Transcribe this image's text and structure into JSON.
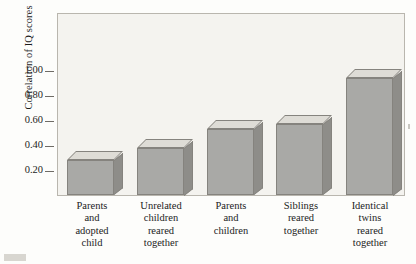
{
  "chart_data": {
    "type": "bar",
    "title": "",
    "xlabel": "",
    "ylabel": "Correlation of IQ scores",
    "categories": [
      "Parents and adopted child",
      "Unrelated children reared together",
      "Parents and children",
      "Siblings reared together",
      "Identical twins reared together"
    ],
    "category_lines": [
      [
        "Parents",
        "and",
        "adopted",
        "child"
      ],
      [
        "Unrelated",
        "children",
        "reared",
        "together"
      ],
      [
        "Parents",
        "and",
        "children"
      ],
      [
        "Siblings",
        "reared",
        "together"
      ],
      [
        "Identical",
        "twins",
        "reared",
        "together"
      ]
    ],
    "values": [
      0.28,
      0.38,
      0.53,
      0.57,
      0.94
    ],
    "ylim": [
      0.0,
      1.1
    ],
    "yticks": [
      0.2,
      0.4,
      0.6,
      0.8,
      1.0
    ],
    "ytick_labels": [
      "0.20",
      "0.40",
      "0.60",
      "0.80",
      "1.00"
    ],
    "grid": false,
    "legend": "none",
    "style": "3d-bars"
  },
  "colors": {
    "bar_front": "#a9a9a6",
    "bar_side": "#8e8d89",
    "bar_top": "#dedcd6",
    "bar_outline": "#85837e",
    "plot_background": "#f4f3ef",
    "plot_border": "#b9b6ae",
    "page_background": "#fdfdfb",
    "text": "#1c1c1c"
  }
}
